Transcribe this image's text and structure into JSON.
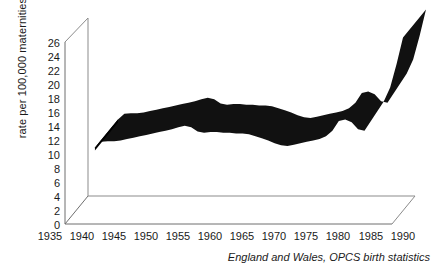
{
  "chart_data": {
    "type": "area",
    "title": "",
    "subtitle": "",
    "xlabel": "",
    "ylabel": "rate per 100,000 maternities",
    "caption": "England and Wales,  OPCS birth statistics",
    "style": "3d-ribbon",
    "grid": false,
    "legend": null,
    "xlim": [
      1935,
      1992
    ],
    "ylim": [
      0,
      27
    ],
    "xticks": [
      1935,
      1940,
      1945,
      1950,
      1955,
      1960,
      1965,
      1970,
      1975,
      1980,
      1985,
      1990
    ],
    "yticks": [
      0,
      2,
      4,
      6,
      8,
      10,
      12,
      14,
      16,
      18,
      20,
      22,
      24,
      26
    ],
    "x": [
      1942,
      1943,
      1944,
      1945,
      1946,
      1947,
      1948,
      1949,
      1950,
      1951,
      1952,
      1953,
      1954,
      1955,
      1956,
      1957,
      1958,
      1959,
      1960,
      1961,
      1962,
      1963,
      1964,
      1965,
      1966,
      1967,
      1968,
      1969,
      1970,
      1971,
      1972,
      1973,
      1974,
      1975,
      1976,
      1977,
      1978,
      1979,
      1980,
      1981,
      1982,
      1983,
      1984,
      1985,
      1986,
      1987,
      1988,
      1989,
      1990
    ],
    "values": [
      11.0,
      11.8,
      11.9,
      11.9,
      12.0,
      12.2,
      12.4,
      12.6,
      12.8,
      13.0,
      13.2,
      13.4,
      13.6,
      13.9,
      14.1,
      13.9,
      13.3,
      13.1,
      13.2,
      13.2,
      13.1,
      13.1,
      13.0,
      13.0,
      12.9,
      12.6,
      12.3,
      12.0,
      11.6,
      11.3,
      11.2,
      11.4,
      11.6,
      11.8,
      12.0,
      12.2,
      12.6,
      13.4,
      14.8,
      15.0,
      14.6,
      13.6,
      13.4,
      14.8,
      16.2,
      17.6,
      19.6,
      23.0,
      26.8
    ],
    "series_name": "rate per 100,000 maternities"
  },
  "axis": {
    "y_label": "rate per 100,000 maternities",
    "y_ticks": [
      "26",
      "24",
      "22",
      "20",
      "18",
      "16",
      "14",
      "12",
      "10",
      "8",
      "6",
      "4",
      "2",
      "0"
    ],
    "x_ticks": [
      "1935",
      "1940",
      "1945",
      "1950",
      "1955",
      "1960",
      "1965",
      "1970",
      "1975",
      "1980",
      "1985",
      "1990"
    ]
  },
  "footer": {
    "caption": "England and Wales,  OPCS birth statistics"
  }
}
